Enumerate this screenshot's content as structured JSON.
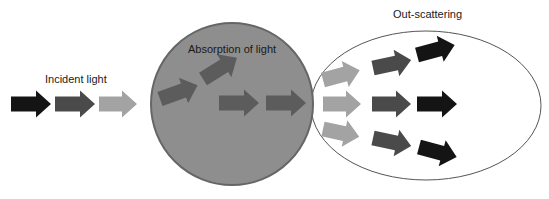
{
  "labels": {
    "incident": "Incident light",
    "absorption": "Absorption of light",
    "scattering": "Out-scattering"
  },
  "colors": {
    "black_arrow": "#141414",
    "dark_arrow": "#4a4a4a",
    "light_arrow": "#a3a3a3",
    "absorber_fill": "#8e8e8e",
    "absorber_stroke": "#666666",
    "absorber_arrow": "#5c5c5c",
    "ellipse_stroke": "#555555"
  },
  "shapes": {
    "absorber_circle": {
      "cx": 232,
      "cy": 104,
      "r": 81
    },
    "scatter_ellipse": {
      "cx": 426,
      "cy": 105.5,
      "rx": 115,
      "ry": 74.5
    }
  },
  "arrows": [
    {
      "group": "incident",
      "x": 11,
      "y": 104,
      "len": 40,
      "angle": 0,
      "color": "black_arrow"
    },
    {
      "group": "incident",
      "x": 55,
      "y": 104,
      "len": 40,
      "angle": 0,
      "color": "dark_arrow"
    },
    {
      "group": "incident",
      "x": 99,
      "y": 104,
      "len": 38,
      "angle": 0,
      "color": "light_arrow"
    },
    {
      "group": "absorption",
      "x": 160,
      "y": 99,
      "len": 40,
      "angle": -20,
      "color": "absorber_arrow"
    },
    {
      "group": "absorption",
      "x": 203,
      "y": 79,
      "len": 40,
      "angle": -32,
      "color": "absorber_arrow"
    },
    {
      "group": "absorption",
      "x": 219,
      "y": 103,
      "len": 40,
      "angle": 0,
      "color": "absorber_arrow"
    },
    {
      "group": "absorption",
      "x": 266,
      "y": 103,
      "len": 40,
      "angle": 0,
      "color": "absorber_arrow"
    },
    {
      "group": "scattering",
      "x": 323,
      "y": 80,
      "len": 38,
      "angle": -15,
      "color": "light_arrow"
    },
    {
      "group": "scattering",
      "x": 323,
      "y": 104,
      "len": 38,
      "angle": 0,
      "color": "light_arrow"
    },
    {
      "group": "scattering",
      "x": 323,
      "y": 129,
      "len": 37,
      "angle": 12,
      "color": "light_arrow"
    },
    {
      "group": "scattering",
      "x": 373,
      "y": 68,
      "len": 39,
      "angle": -12,
      "color": "dark_arrow"
    },
    {
      "group": "scattering",
      "x": 372,
      "y": 104,
      "len": 39,
      "angle": 0,
      "color": "dark_arrow"
    },
    {
      "group": "scattering",
      "x": 373,
      "y": 138,
      "len": 39,
      "angle": 12,
      "color": "dark_arrow"
    },
    {
      "group": "scattering",
      "x": 417,
      "y": 55,
      "len": 39,
      "angle": -15,
      "color": "black_arrow"
    },
    {
      "group": "scattering",
      "x": 417,
      "y": 104,
      "len": 40,
      "angle": 0,
      "color": "black_arrow"
    },
    {
      "group": "scattering",
      "x": 419,
      "y": 147,
      "len": 39,
      "angle": 15,
      "color": "black_arrow"
    }
  ]
}
